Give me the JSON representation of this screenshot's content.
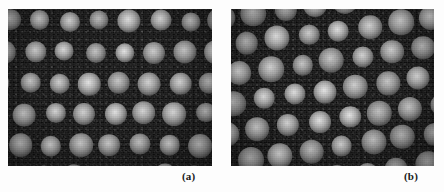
{
  "figure": {
    "background_color": "#fdfdfd",
    "panel_background_color": "#1b1b1b",
    "dot_color": "#e8e8e8",
    "label_color": "#1a1a1a",
    "panels": [
      {
        "id": "a",
        "label": "(a)",
        "lattice_type": "regular hexagonal close-packed array of bright spots",
        "rows": 5,
        "columns": 7,
        "spacing_x_px": 30,
        "spacing_y_px": 31,
        "row_shear_px": -5,
        "rotation_deg": 0,
        "dot_diameter_px": 21,
        "origin_x_px": 2,
        "origin_y_px": 12
      },
      {
        "id": "b",
        "label": "(b)",
        "lattice_type": "rotated oblique array of bright spots with diagonal rows",
        "rows": 7,
        "columns": 7,
        "spacing_x_px": 31,
        "spacing_y_px": 29,
        "row_shear_px": 20,
        "rotation_deg": -8,
        "dot_diameter_px": 23,
        "origin_x_px": -28,
        "origin_y_px": -6
      }
    ]
  }
}
